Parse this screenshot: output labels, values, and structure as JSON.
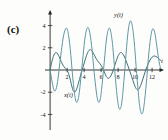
{
  "figure": {
    "panel_label": "(c)",
    "background_color": "#fdfdfc"
  },
  "chart_data": {
    "type": "line",
    "title": "",
    "subtitle": "",
    "xlabel": "t",
    "ylabel": "",
    "xlim": [
      -0.6,
      13.4
    ],
    "ylim": [
      -5.4,
      5.4
    ],
    "grid": false,
    "legend": "inline-annotations",
    "axis_color": "#222222",
    "xticks": [
      2,
      4,
      6,
      8,
      10,
      12
    ],
    "xtick_labels": [
      "2",
      "4",
      "6",
      "8",
      "10",
      "12"
    ],
    "yticks": [
      4,
      2,
      -2,
      -4
    ],
    "ytick_labels": [
      "4",
      "2",
      "-2",
      "-4"
    ],
    "annotations": [
      {
        "text": "y(t)",
        "x": 8.05,
        "y": 4.75,
        "name": "curve-label-y"
      },
      {
        "text": "x(t)",
        "x": 2.15,
        "y": -2.45,
        "name": "curve-label-x"
      },
      {
        "text": "t",
        "x": 13.15,
        "y": 0.62,
        "name": "x-axis-name"
      }
    ],
    "series": [
      {
        "name": "x(t)",
        "color": "#3f6f78",
        "line_width": 1.0,
        "amplitude_range": [
          -2.1,
          2.1
        ],
        "description": "lower-amplitude modulated oscillation",
        "points": [
          [
            0.0,
            0.0
          ],
          [
            0.15,
            0.55
          ],
          [
            0.3,
            1.02
          ],
          [
            0.45,
            1.36
          ],
          [
            0.6,
            1.54
          ],
          [
            0.75,
            1.56
          ],
          [
            0.9,
            1.44
          ],
          [
            1.05,
            1.22
          ],
          [
            1.2,
            0.95
          ],
          [
            1.35,
            0.68
          ],
          [
            1.5,
            0.45
          ],
          [
            1.65,
            0.28
          ],
          [
            1.8,
            0.14
          ],
          [
            1.95,
            0.02
          ],
          [
            2.1,
            -0.18
          ],
          [
            2.25,
            -0.5
          ],
          [
            2.4,
            -0.95
          ],
          [
            2.55,
            -1.44
          ],
          [
            2.7,
            -1.82
          ],
          [
            2.85,
            -1.99
          ],
          [
            3.0,
            -1.92
          ],
          [
            3.15,
            -1.66
          ],
          [
            3.3,
            -1.28
          ],
          [
            3.45,
            -0.86
          ],
          [
            3.6,
            -0.44
          ],
          [
            3.75,
            -0.04
          ],
          [
            3.9,
            0.34
          ],
          [
            4.05,
            0.72
          ],
          [
            4.2,
            1.1
          ],
          [
            4.35,
            1.44
          ],
          [
            4.5,
            1.69
          ],
          [
            4.65,
            1.82
          ],
          [
            4.8,
            1.82
          ],
          [
            4.95,
            1.7
          ],
          [
            5.1,
            1.5
          ],
          [
            5.25,
            1.27
          ],
          [
            5.4,
            1.05
          ],
          [
            5.55,
            0.87
          ],
          [
            5.7,
            0.72
          ],
          [
            5.85,
            0.58
          ],
          [
            6.0,
            0.42
          ],
          [
            6.15,
            0.22
          ],
          [
            6.3,
            -0.04
          ],
          [
            6.45,
            -0.32
          ],
          [
            6.6,
            -0.58
          ],
          [
            6.75,
            -0.72
          ],
          [
            6.9,
            -0.74
          ],
          [
            7.05,
            -0.64
          ],
          [
            7.2,
            -0.44
          ],
          [
            7.35,
            -0.18
          ],
          [
            7.5,
            0.14
          ],
          [
            7.65,
            0.5
          ],
          [
            7.8,
            0.86
          ],
          [
            7.95,
            1.18
          ],
          [
            8.1,
            1.42
          ],
          [
            8.25,
            1.55
          ],
          [
            8.4,
            1.56
          ],
          [
            8.55,
            1.46
          ],
          [
            8.7,
            1.26
          ],
          [
            8.85,
            1.0
          ],
          [
            9.0,
            0.7
          ],
          [
            9.15,
            0.38
          ],
          [
            9.3,
            0.06
          ],
          [
            9.45,
            -0.26
          ],
          [
            9.6,
            -0.6
          ],
          [
            9.75,
            -0.96
          ],
          [
            9.9,
            -1.3
          ],
          [
            10.05,
            -1.58
          ],
          [
            10.2,
            -1.74
          ],
          [
            10.35,
            -1.76
          ],
          [
            10.5,
            -1.64
          ],
          [
            10.65,
            -1.4
          ],
          [
            10.8,
            -1.08
          ],
          [
            10.95,
            -0.72
          ],
          [
            11.1,
            -0.36
          ],
          [
            11.25,
            -0.02
          ],
          [
            11.4,
            0.3
          ],
          [
            11.55,
            0.58
          ],
          [
            11.7,
            0.82
          ],
          [
            11.85,
            1.02
          ],
          [
            12.0,
            1.16
          ],
          [
            12.15,
            1.24
          ],
          [
            12.3,
            1.26
          ],
          [
            12.45,
            1.22
          ],
          [
            12.6,
            1.14
          ],
          [
            12.75,
            1.04
          ],
          [
            12.9,
            0.94
          ],
          [
            13.0,
            0.88
          ]
        ]
      },
      {
        "name": "y(t)",
        "color": "#5e98a4",
        "line_width": 1.0,
        "amplitude_range": [
          -4.6,
          5.1
        ],
        "description": "higher-amplitude beating oscillation",
        "points": [
          [
            0.0,
            0.0
          ],
          [
            0.12,
            -0.55
          ],
          [
            0.25,
            -1.15
          ],
          [
            0.38,
            -1.62
          ],
          [
            0.5,
            -1.88
          ],
          [
            0.62,
            -1.86
          ],
          [
            0.75,
            -1.58
          ],
          [
            0.88,
            -1.05
          ],
          [
            1.0,
            -0.35
          ],
          [
            1.12,
            0.45
          ],
          [
            1.25,
            1.28
          ],
          [
            1.38,
            2.05
          ],
          [
            1.5,
            2.7
          ],
          [
            1.62,
            3.22
          ],
          [
            1.75,
            3.58
          ],
          [
            1.88,
            3.76
          ],
          [
            2.0,
            3.7
          ],
          [
            2.12,
            3.34
          ],
          [
            2.25,
            2.7
          ],
          [
            2.38,
            1.82
          ],
          [
            2.5,
            0.8
          ],
          [
            2.62,
            -0.28
          ],
          [
            2.75,
            -1.3
          ],
          [
            2.88,
            -2.14
          ],
          [
            3.0,
            -2.7
          ],
          [
            3.12,
            -2.92
          ],
          [
            3.25,
            -2.78
          ],
          [
            3.38,
            -2.32
          ],
          [
            3.5,
            -1.6
          ],
          [
            3.62,
            -0.7
          ],
          [
            3.75,
            0.3
          ],
          [
            3.88,
            1.3
          ],
          [
            4.0,
            2.22
          ],
          [
            4.12,
            2.98
          ],
          [
            4.25,
            3.52
          ],
          [
            4.38,
            3.8
          ],
          [
            4.5,
            3.8
          ],
          [
            4.62,
            3.52
          ],
          [
            4.75,
            2.98
          ],
          [
            4.88,
            2.22
          ],
          [
            5.0,
            1.3
          ],
          [
            5.12,
            0.3
          ],
          [
            5.25,
            -0.7
          ],
          [
            5.38,
            -1.6
          ],
          [
            5.5,
            -2.32
          ],
          [
            5.62,
            -2.78
          ],
          [
            5.75,
            -2.92
          ],
          [
            5.88,
            -2.7
          ],
          [
            6.0,
            -2.14
          ],
          [
            6.12,
            -1.3
          ],
          [
            6.25,
            -0.28
          ],
          [
            6.38,
            0.8
          ],
          [
            6.5,
            1.82
          ],
          [
            6.62,
            2.7
          ],
          [
            6.75,
            3.34
          ],
          [
            6.88,
            3.7
          ],
          [
            7.0,
            3.76
          ],
          [
            7.12,
            3.5
          ],
          [
            7.25,
            2.92
          ],
          [
            7.38,
            2.05
          ],
          [
            7.5,
            0.98
          ],
          [
            7.62,
            -0.18
          ],
          [
            7.75,
            -1.32
          ],
          [
            7.88,
            -2.32
          ],
          [
            8.0,
            -3.06
          ],
          [
            8.12,
            -3.48
          ],
          [
            8.25,
            -3.52
          ],
          [
            8.38,
            -3.18
          ],
          [
            8.5,
            -2.5
          ],
          [
            8.62,
            -1.52
          ],
          [
            8.75,
            -0.36
          ],
          [
            8.88,
            0.88
          ],
          [
            9.0,
            2.05
          ],
          [
            9.12,
            3.08
          ],
          [
            9.25,
            3.86
          ],
          [
            9.38,
            4.32
          ],
          [
            9.5,
            4.42
          ],
          [
            9.62,
            4.16
          ],
          [
            9.75,
            3.56
          ],
          [
            9.88,
            2.66
          ],
          [
            10.0,
            1.55
          ],
          [
            10.12,
            0.32
          ],
          [
            10.25,
            -0.92
          ],
          [
            10.38,
            -2.06
          ],
          [
            10.5,
            -3.0
          ],
          [
            10.62,
            -3.64
          ],
          [
            10.75,
            -3.94
          ],
          [
            10.88,
            -3.88
          ],
          [
            11.0,
            -3.46
          ],
          [
            11.12,
            -2.74
          ],
          [
            11.25,
            -1.78
          ],
          [
            11.38,
            -0.68
          ],
          [
            11.5,
            0.46
          ],
          [
            11.62,
            1.54
          ],
          [
            11.75,
            2.48
          ],
          [
            11.88,
            3.18
          ],
          [
            12.0,
            3.6
          ],
          [
            12.12,
            3.72
          ],
          [
            12.25,
            3.54
          ],
          [
            12.38,
            3.1
          ],
          [
            12.5,
            2.48
          ],
          [
            12.62,
            1.78
          ],
          [
            12.75,
            1.1
          ],
          [
            12.88,
            0.52
          ],
          [
            13.0,
            0.14
          ]
        ]
      }
    ],
    "peaks_y": [
      {
        "t": 1.9,
        "value": 3.8
      },
      {
        "t": 4.45,
        "value": 3.8
      },
      {
        "t": 7.0,
        "value": 3.76
      },
      {
        "t": 9.5,
        "value": 4.42
      },
      {
        "t": 12.1,
        "value": 3.72
      }
    ],
    "troughs_y": [
      {
        "t": 3.1,
        "value": -2.92
      },
      {
        "t": 5.8,
        "value": -2.92
      },
      {
        "t": 8.25,
        "value": -3.52
      },
      {
        "t": 10.8,
        "value": -3.94
      }
    ]
  }
}
